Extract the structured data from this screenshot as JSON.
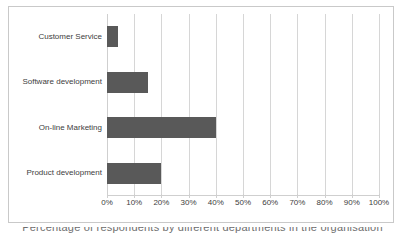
{
  "chart_data": {
    "type": "bar",
    "orientation": "horizontal",
    "title": "",
    "xlabel": "",
    "ylabel": "",
    "categories": [
      "Customer Service",
      "Software development",
      "On-line Marketing",
      "Product development"
    ],
    "values": [
      4,
      15,
      40,
      20
    ],
    "value_suffix": "%",
    "xlim": [
      0,
      100
    ],
    "xticks": [
      0,
      10,
      20,
      30,
      40,
      50,
      60,
      70,
      80,
      90,
      100
    ],
    "xtick_labels": [
      "0%",
      "10%",
      "20%",
      "30%",
      "40%",
      "50%",
      "60%",
      "70%",
      "80%",
      "90%",
      "100%"
    ],
    "grid": true,
    "grid_axis": "x",
    "legend": false,
    "series": [
      {
        "name": "Share",
        "values": [
          4,
          15,
          40,
          20
        ]
      }
    ],
    "bar_color": "#595959",
    "gridline_color": "#d6d6d6",
    "frame_color": "#c9c9c9",
    "label_color": "#404040"
  },
  "caption": {
    "text": "Percentage of respondents by different departments in the organisation"
  }
}
